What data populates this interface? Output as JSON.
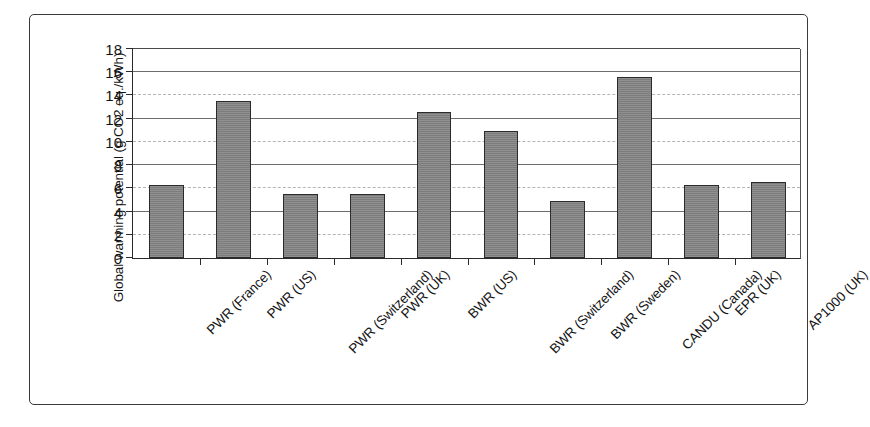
{
  "chart_data": {
    "type": "bar",
    "title": "",
    "xlabel": "",
    "ylabel": "Global warming potential (g CO2 eq./kWh)",
    "ylim": [
      0,
      18
    ],
    "ytick_step": 2,
    "yticks": [
      0,
      2,
      4,
      6,
      8,
      10,
      12,
      14,
      16,
      18
    ],
    "grid": true,
    "legend": "none",
    "bar_color": "#838383",
    "bar_edge_color": "#2b2b2b",
    "categories": [
      "PWR (France)",
      "PWR (US)",
      "PWR (Switzerland)",
      "PWR (UK)",
      "BWR (US)",
      "BWR (Switzerland)",
      "BWR (Sweden)",
      "CANDU (Canada)",
      "EPR (UK)",
      "AP1000 (UK)"
    ],
    "values": [
      6.3,
      13.5,
      5.5,
      5.5,
      12.5,
      10.9,
      4.9,
      15.5,
      6.3,
      6.5
    ]
  }
}
